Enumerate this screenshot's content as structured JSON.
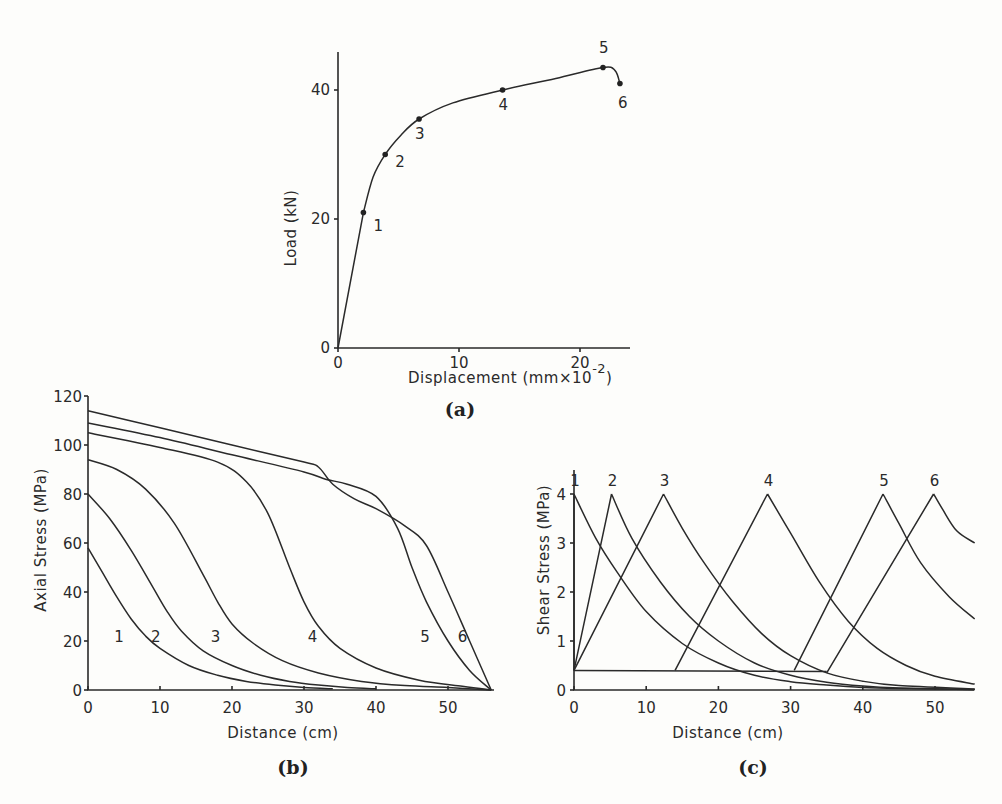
{
  "chart_data": [
    {
      "id": "a",
      "type": "line",
      "caption": "(a)",
      "title": "",
      "xlabel": "Displacement (mm×10",
      "xlabel_sup": "-2",
      "xlabel_close": ")",
      "ylabel": "Load (kN)",
      "xlim": [
        0,
        25
      ],
      "ylim": [
        0,
        46
      ],
      "xticks": [
        0,
        10,
        20
      ],
      "yticks": [
        0,
        20,
        40
      ],
      "grid": false,
      "series": [
        {
          "name": "Load-displacement",
          "x": [
            0,
            1.0,
            2.1,
            2.9,
            3.9,
            5.2,
            6.7,
            9.5,
            13.6,
            18,
            21.9,
            22.9,
            23.3
          ],
          "y": [
            0,
            10.5,
            21,
            26.5,
            30,
            33,
            35.5,
            38,
            40,
            41.8,
            43.5,
            43,
            41
          ]
        }
      ],
      "marked_points": [
        {
          "label": "1",
          "x": 2.1,
          "y": 21
        },
        {
          "label": "2",
          "x": 3.9,
          "y": 30
        },
        {
          "label": "3",
          "x": 6.7,
          "y": 35.5
        },
        {
          "label": "4",
          "x": 13.6,
          "y": 40
        },
        {
          "label": "5",
          "x": 21.9,
          "y": 43.5
        },
        {
          "label": "6",
          "x": 23.3,
          "y": 41
        }
      ]
    },
    {
      "id": "b",
      "type": "line",
      "caption": "(b)",
      "xlabel": "Distance (cm)",
      "ylabel": "Axial Stress (MPa)",
      "xlim": [
        0,
        56
      ],
      "ylim": [
        0,
        120
      ],
      "xticks": [
        0,
        10,
        20,
        30,
        40,
        50
      ],
      "yticks": [
        0,
        20,
        40,
        60,
        80,
        100,
        120
      ],
      "grid": false,
      "series": [
        {
          "name": "1",
          "x": [
            0,
            2,
            4,
            6,
            8,
            10,
            14,
            18,
            22,
            26,
            30,
            34
          ],
          "y": [
            58,
            48,
            38,
            29,
            22,
            17,
            10,
            6,
            3.5,
            2,
            1,
            0.5
          ]
        },
        {
          "name": "2",
          "x": [
            0,
            3,
            6,
            9,
            11,
            13,
            16,
            20,
            24,
            28,
            32,
            36,
            40
          ],
          "y": [
            80,
            70,
            57,
            42,
            32,
            24,
            16,
            10,
            6,
            3.5,
            2,
            1,
            0.5
          ]
        },
        {
          "name": "3",
          "x": [
            0,
            4,
            8,
            12,
            16,
            18,
            20,
            23,
            27,
            32,
            38,
            44,
            50,
            56
          ],
          "y": [
            94,
            90,
            82,
            68,
            47,
            36,
            27,
            19,
            12,
            7,
            3.5,
            1.8,
            1,
            0
          ]
        },
        {
          "name": "4",
          "x": [
            0,
            10,
            18,
            22,
            25,
            28,
            30,
            32,
            35,
            40,
            46,
            52,
            56
          ],
          "y": [
            105,
            99,
            93,
            85,
            72,
            50,
            36,
            26,
            17,
            9,
            4,
            1.5,
            0
          ]
        },
        {
          "name": "5",
          "x": [
            0,
            10,
            20,
            30,
            33,
            36,
            40,
            43,
            45,
            47,
            50,
            53,
            56
          ],
          "y": [
            109,
            103,
            96,
            89,
            86,
            84,
            79,
            66,
            50,
            36,
            20,
            8,
            0
          ]
        },
        {
          "name": "6",
          "x": [
            0,
            10,
            20,
            30,
            32,
            34,
            37,
            40,
            44,
            47,
            50,
            53,
            56
          ],
          "y": [
            114,
            107,
            100,
            93,
            91,
            84,
            78,
            74,
            67,
            59,
            40,
            20,
            0
          ]
        }
      ],
      "curve_labels": [
        {
          "label": "1",
          "x": 4.3,
          "y": 22
        },
        {
          "label": "2",
          "x": 9.4,
          "y": 22
        },
        {
          "label": "3",
          "x": 17.7,
          "y": 22
        },
        {
          "label": "4",
          "x": 31.2,
          "y": 22
        },
        {
          "label": "5",
          "x": 46.8,
          "y": 22
        },
        {
          "label": "6",
          "x": 52,
          "y": 22
        }
      ]
    },
    {
      "id": "c",
      "type": "line",
      "caption": "(c)",
      "xlabel": "Distance (cm)",
      "ylabel": "Shear Stress (MPa)",
      "xlim": [
        0,
        55.5
      ],
      "ylim": [
        0,
        4.5
      ],
      "xticks": [
        0,
        10,
        20,
        30,
        40,
        50
      ],
      "yticks": [
        0,
        1,
        2,
        3,
        4
      ],
      "grid": false,
      "series": [
        {
          "name": "1",
          "x": [
            0,
            0,
            3,
            6,
            10,
            15,
            20,
            25,
            30,
            35,
            40,
            45,
            55.5
          ],
          "y": [
            0.4,
            4,
            3.1,
            2.4,
            1.6,
            0.95,
            0.55,
            0.3,
            0.17,
            0.1,
            0.05,
            0.03,
            0.01
          ]
        },
        {
          "name": "2",
          "x": [
            0,
            0,
            2.5,
            5.2,
            8,
            12,
            16,
            20,
            25,
            30,
            35,
            40,
            45,
            55.5
          ],
          "y": [
            0.4,
            2.7,
            3.3,
            4,
            3.1,
            2.2,
            1.5,
            1.0,
            0.55,
            0.3,
            0.16,
            0.08,
            0.04,
            0.01
          ]
        },
        {
          "name": "3",
          "x": [
            0,
            21,
            0,
            6,
            12.4,
            15,
            18,
            22,
            26,
            30,
            35,
            40,
            45,
            55.5
          ],
          "y": [
            0.4,
            0.4,
            0.4,
            2.1,
            4,
            3.3,
            2.6,
            1.8,
            1.15,
            0.7,
            0.35,
            0.18,
            0.09,
            0.02
          ]
        },
        {
          "name": "4",
          "x": [
            0,
            14,
            14,
            20,
            26.8,
            30,
            34,
            38,
            42,
            46,
            50,
            55.5
          ],
          "y": [
            0.4,
            0.4,
            0.4,
            2.0,
            4,
            3.2,
            2.2,
            1.4,
            0.85,
            0.5,
            0.28,
            0.12
          ]
        },
        {
          "name": "5",
          "x": [
            0,
            30.5,
            30.5,
            36,
            42.8,
            45,
            48,
            52,
            55.5
          ],
          "y": [
            0.4,
            0.4,
            0.4,
            2.3,
            4,
            3.4,
            2.6,
            1.9,
            1.45
          ]
        },
        {
          "name": "6",
          "x": [
            0,
            35,
            35,
            42,
            49.8,
            51,
            53,
            55.5
          ],
          "y": [
            0.4,
            0.35,
            0.35,
            2.7,
            4,
            3.7,
            3.25,
            3.0
          ]
        }
      ],
      "peak_labels": [
        {
          "label": "1",
          "x": 0,
          "y": 4.2
        },
        {
          "label": "2",
          "x": 5.2,
          "y": 4.2
        },
        {
          "label": "3",
          "x": 12.4,
          "y": 4.2
        },
        {
          "label": "4",
          "x": 26.8,
          "y": 4.2
        },
        {
          "label": "5",
          "x": 42.8,
          "y": 4.2
        },
        {
          "label": "6",
          "x": 49.8,
          "y": 4.2
        }
      ]
    }
  ],
  "captions": {
    "a": "(a)",
    "b": "(b)",
    "c": "(c)"
  }
}
